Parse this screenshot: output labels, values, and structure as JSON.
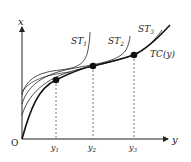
{
  "diagram": {
    "axes": {
      "x_axis_label": "y",
      "y_axis_label": "x",
      "origin_label": "O"
    },
    "curves": {
      "st1": {
        "label": "ST",
        "sub": "1"
      },
      "st2": {
        "label": "ST",
        "sub": "2"
      },
      "st3": {
        "label": "ST",
        "sub": "3"
      },
      "tc": {
        "label": "TC(y)"
      }
    },
    "ticks": [
      {
        "label": "y",
        "sub": "1"
      },
      {
        "label": "y",
        "sub": "2"
      },
      {
        "label": "y",
        "sub": "3"
      }
    ],
    "colors": {
      "line": "#222222",
      "dash": "#555555"
    }
  }
}
